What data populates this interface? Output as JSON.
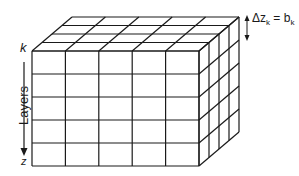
{
  "diagram": {
    "labels": {
      "top_axis_label": "k",
      "bottom_axis_label": "z",
      "axis_title": "Layers",
      "thickness_annotation": "Δz_k = b_k",
      "thickness_annotation_display": "Δz",
      "thickness_sub_k": "k",
      "thickness_eq": " = b",
      "thickness_sub_k2": "k"
    },
    "grid": {
      "front_columns": 5,
      "layers": 5,
      "depth_divisions": 4
    },
    "colors": {
      "line": "#1a1a1a",
      "background": "#ffffff"
    }
  }
}
